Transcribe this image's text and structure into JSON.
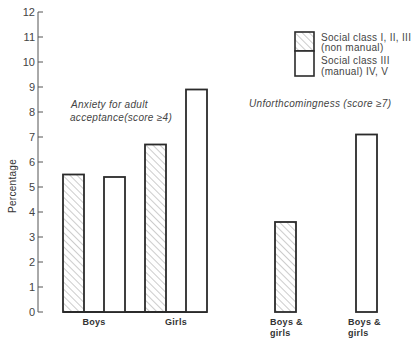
{
  "chart_data": {
    "type": "bar",
    "title": "",
    "xlabel": "",
    "ylabel": "Percentage",
    "ylim": [
      0,
      12
    ],
    "yticks": [
      0,
      1,
      2,
      3,
      4,
      5,
      6,
      7,
      8,
      9,
      10,
      11,
      12
    ],
    "grid": false,
    "legend_position": "top-right",
    "groups": [
      {
        "annotation": [
          "Anxiety for adult",
          "acceptance(score ≥4)"
        ],
        "categories": [
          "Boys",
          "Girls"
        ],
        "series": [
          {
            "name": "Social class I, II, III (non manual)",
            "pattern": "hatched",
            "values": [
              5.5,
              6.7
            ]
          },
          {
            "name": "Social class III (manual) IV, V",
            "pattern": "white",
            "values": [
              5.4,
              8.9
            ]
          }
        ]
      },
      {
        "annotation": [
          "Unforthcomingness (score ≥7)"
        ],
        "categories": [
          "Boys & girls",
          "Boys & girls"
        ],
        "series": [
          {
            "name": "Social class I, II, III (non manual)",
            "pattern": "hatched",
            "values": [
              3.6,
              null
            ]
          },
          {
            "name": "Social class III (manual) IV, V",
            "pattern": "white",
            "values": [
              null,
              7.1
            ]
          }
        ]
      }
    ],
    "legend": [
      {
        "pattern": "hatched",
        "lines": [
          "Social class I, II, III",
          "(non manual)"
        ]
      },
      {
        "pattern": "white",
        "lines": [
          "Social class III",
          "(manual) IV, V"
        ]
      }
    ]
  },
  "labels": {
    "ylabel": "Percentage",
    "ticks": [
      "0",
      "1",
      "2",
      "3",
      "4",
      "5",
      "6",
      "7",
      "8",
      "9",
      "10",
      "11",
      "12"
    ],
    "cat_boys": "Boys",
    "cat_girls": "Girls",
    "cat_bg1_line1": "Boys &",
    "cat_bg1_line2": "girls",
    "cat_bg2_line1": "Boys &",
    "cat_bg2_line2": "girls",
    "anxiety_line1": "Anxiety for adult",
    "anxiety_line2": "acceptance(score ≥4)",
    "unforth": "Unforthcomingness (score ≥7)",
    "legend1_line1": "Social class I, II, III",
    "legend1_line2": "(non manual)",
    "legend2_line1": "Social class III",
    "legend2_line2": "(manual) IV, V"
  },
  "colors": {
    "ink": "#2b2b2b",
    "hatch": "#8a8a8a",
    "background": "#ffffff"
  }
}
